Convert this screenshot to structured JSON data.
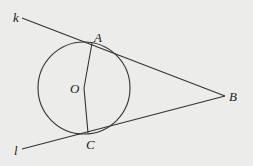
{
  "figure": {
    "type": "geometry-diagram",
    "colors": {
      "background": "#ececea",
      "stroke": "#333333",
      "text": "#222222"
    },
    "circle": {
      "center_label": "O",
      "cx": 84,
      "cy": 88,
      "r": 46
    },
    "points": [
      {
        "id": "A",
        "label": "A",
        "x": 92,
        "y": 43,
        "label_x": 94,
        "label_y": 42
      },
      {
        "id": "B",
        "label": "B",
        "x": 225,
        "y": 96,
        "label_x": 229,
        "label_y": 101
      },
      {
        "id": "C",
        "label": "C",
        "x": 88,
        "y": 133,
        "label_x": 86,
        "label_y": 149
      },
      {
        "id": "O",
        "label": "O",
        "x": 84,
        "y": 88,
        "label_x": 70,
        "label_y": 93
      }
    ],
    "lines": [
      {
        "id": "k",
        "label": "k",
        "from": [
          22,
          18
        ],
        "to": [
          225,
          96
        ],
        "label_x": 13,
        "label_y": 22
      },
      {
        "id": "l",
        "label": "l",
        "from": [
          22,
          149
        ],
        "to": [
          225,
          96
        ],
        "label_x": 14,
        "label_y": 155
      }
    ],
    "segments": [
      {
        "id": "OA",
        "from": "O",
        "to": "A"
      },
      {
        "id": "OC",
        "from": "O",
        "to": "C"
      }
    ]
  }
}
